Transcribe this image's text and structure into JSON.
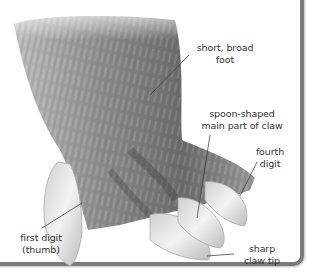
{
  "diagram": {
    "colors": {
      "background": "#ffffff",
      "fur_dark": "#4a4a4a",
      "fur_mid": "#8a8a8a",
      "fur_light": "#c4c4c4",
      "claw": "#e6e6e6",
      "claw_shadow": "#b5b5b5",
      "text": "#333333",
      "leader_line": "#444444",
      "panel_border": "#7a7a7a"
    },
    "labels": [
      {
        "id": "short-broad-foot",
        "lines": [
          "short, broad",
          "foot"
        ]
      },
      {
        "id": "spoon-shaped-claw",
        "lines": [
          "spoon-shaped",
          "main part of claw"
        ]
      },
      {
        "id": "fourth-digit",
        "lines": [
          "fourth",
          "digit"
        ]
      },
      {
        "id": "first-digit",
        "lines": [
          "first digit",
          "(thumb)"
        ]
      },
      {
        "id": "sharp-claw-tip",
        "lines": [
          "sharp",
          "claw tip"
        ]
      }
    ]
  }
}
